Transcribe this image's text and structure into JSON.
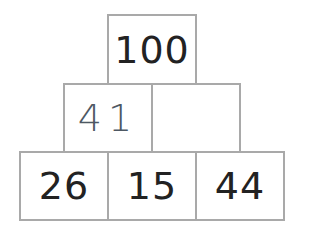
{
  "pyramid": {
    "rows": [
      {
        "cells": [
          {
            "value": "100",
            "style": "given"
          }
        ]
      },
      {
        "cells": [
          {
            "value": "41",
            "style": "handwritten"
          },
          {
            "value": "",
            "style": "empty"
          }
        ]
      },
      {
        "cells": [
          {
            "value": "26",
            "style": "given"
          },
          {
            "value": "15",
            "style": "given"
          },
          {
            "value": "44",
            "style": "given"
          }
        ]
      }
    ]
  },
  "colors": {
    "border": "#a9a9a9",
    "given_text": "#222222",
    "handwritten_text": "#4e5863",
    "background": "#ffffff"
  }
}
